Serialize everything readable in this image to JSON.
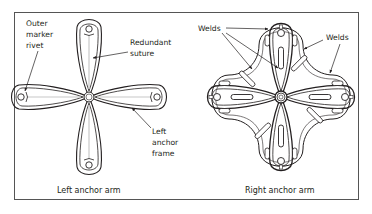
{
  "figure": {
    "panels": [
      {
        "id": "left",
        "caption": "Left anchor arm",
        "labels": {
          "outer_marker_rivet": [
            "Outer",
            "marker",
            "rivet"
          ],
          "redundant_suture": [
            "Redundant",
            "suture"
          ],
          "left_anchor_frame": [
            "Left",
            "anchor",
            "frame"
          ]
        }
      },
      {
        "id": "right",
        "caption": "Right anchor arm",
        "labels": {
          "welds_left": "Welds",
          "welds_right": "Welds"
        }
      }
    ],
    "colors": {
      "line": "#231f20",
      "suture": "#c8c8c8",
      "border": "#555555",
      "background": "#ffffff"
    }
  }
}
